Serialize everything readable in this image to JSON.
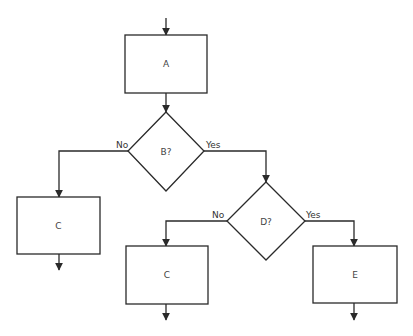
{
  "diagram": {
    "type": "flowchart",
    "colors": {
      "stroke": "#2a2a2a",
      "text": "#444444",
      "background": "#ffffff"
    },
    "nodes": {
      "A": {
        "shape": "process",
        "label": "A"
      },
      "B": {
        "shape": "decision",
        "label": "B?"
      },
      "C1": {
        "shape": "process",
        "label": "C"
      },
      "D": {
        "shape": "decision",
        "label": "D?"
      },
      "C2": {
        "shape": "process",
        "label": "C"
      },
      "E": {
        "shape": "process",
        "label": "E"
      }
    },
    "edges": {
      "entry_to_A": {
        "from": "start",
        "to": "A",
        "label": ""
      },
      "A_to_B": {
        "from": "A",
        "to": "B",
        "label": ""
      },
      "B_no": {
        "from": "B",
        "to": "C1",
        "label": "No"
      },
      "B_yes": {
        "from": "B",
        "to": "D",
        "label": "Yes"
      },
      "D_no": {
        "from": "D",
        "to": "C2",
        "label": "No"
      },
      "D_yes": {
        "from": "D",
        "to": "E",
        "label": "Yes"
      },
      "C1_out": {
        "from": "C1",
        "to": "exit",
        "label": ""
      },
      "C2_out": {
        "from": "C2",
        "to": "exit",
        "label": ""
      },
      "E_out": {
        "from": "E",
        "to": "exit",
        "label": ""
      }
    }
  }
}
